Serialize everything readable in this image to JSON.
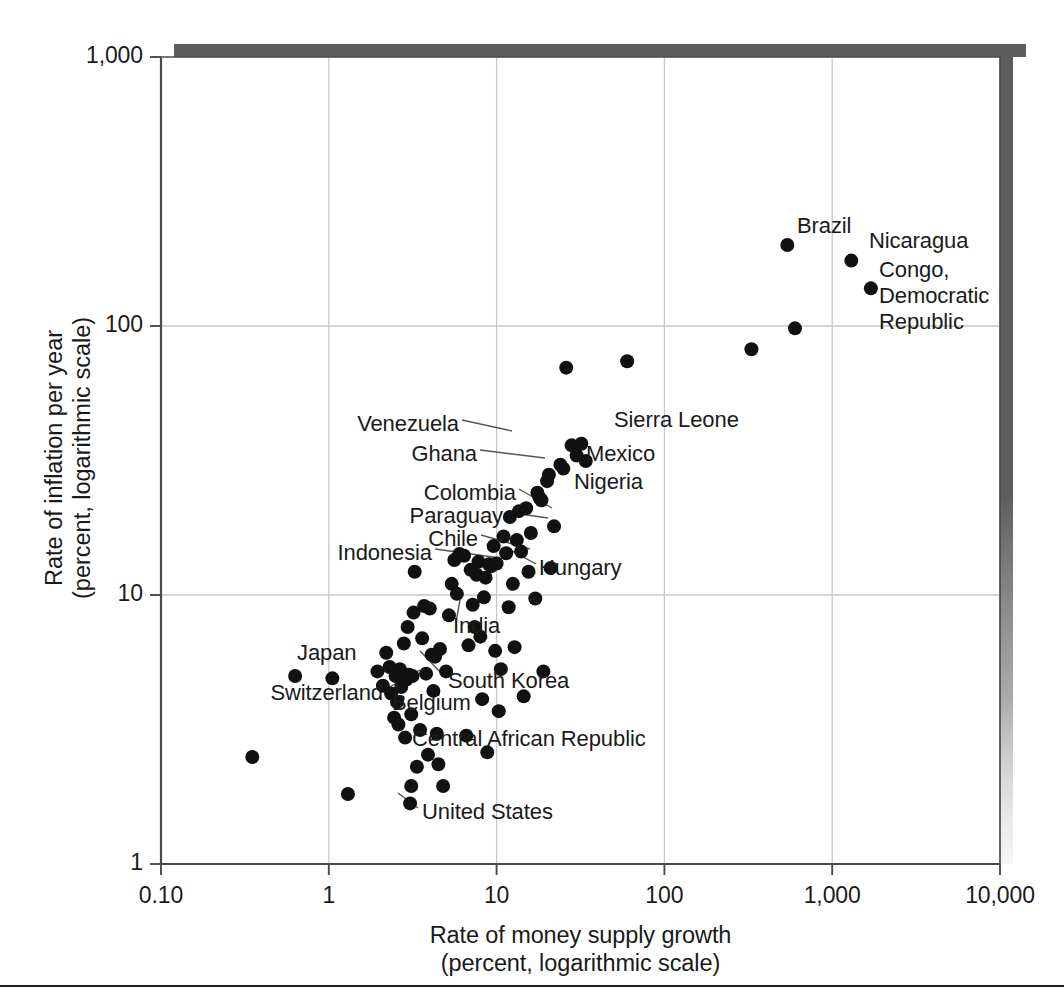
{
  "chart_data": {
    "type": "scatter",
    "title": "",
    "xlabel": "Rate of money supply growth\n(percent, logarithmic scale)",
    "xlabel_line1": "Rate of money supply growth",
    "xlabel_line2": "(percent, logarithmic scale)",
    "ylabel": "Rate of inflation per year\n(percent, logarithmic scale)",
    "ylabel_line1": "Rate of inflation per year",
    "ylabel_line2": "(percent, logarithmic scale)",
    "xscale": "log",
    "yscale": "log",
    "xlim": [
      0.1,
      10000
    ],
    "ylim": [
      1,
      1000
    ],
    "grid": true,
    "legend": "none",
    "x_ticks": [
      {
        "value": 0.1,
        "label": "0.10"
      },
      {
        "value": 1,
        "label": "1"
      },
      {
        "value": 10,
        "label": "10"
      },
      {
        "value": 100,
        "label": "100"
      },
      {
        "value": 1000,
        "label": "1,000"
      },
      {
        "value": 10000,
        "label": "10,000"
      }
    ],
    "y_ticks": [
      {
        "value": 1,
        "label": "1"
      },
      {
        "value": 10,
        "label": "10"
      },
      {
        "value": 100,
        "label": "100"
      },
      {
        "value": 1000,
        "label": "1,000"
      }
    ],
    "marker": {
      "shape": "circle",
      "color": "#111111",
      "radius_px": 7
    },
    "points": [
      {
        "x": 0.35,
        "y": 2.5,
        "label": ""
      },
      {
        "x": 0.63,
        "y": 5.0,
        "label": "Japan"
      },
      {
        "x": 1.05,
        "y": 4.9,
        "label": "Switzerland"
      },
      {
        "x": 1.3,
        "y": 1.82,
        "label": ""
      },
      {
        "x": 1.95,
        "y": 5.2,
        "label": ""
      },
      {
        "x": 2.1,
        "y": 4.6,
        "label": ""
      },
      {
        "x": 2.2,
        "y": 6.1,
        "label": ""
      },
      {
        "x": 2.3,
        "y": 5.4,
        "label": ""
      },
      {
        "x": 2.35,
        "y": 4.3,
        "label": ""
      },
      {
        "x": 2.45,
        "y": 3.5,
        "label": ""
      },
      {
        "x": 2.5,
        "y": 5.0,
        "label": "Belgium"
      },
      {
        "x": 2.55,
        "y": 4.0,
        "label": ""
      },
      {
        "x": 2.6,
        "y": 3.3,
        "label": ""
      },
      {
        "x": 2.65,
        "y": 5.3,
        "label": ""
      },
      {
        "x": 2.7,
        "y": 4.55,
        "label": ""
      },
      {
        "x": 2.8,
        "y": 6.6,
        "label": ""
      },
      {
        "x": 2.85,
        "y": 2.95,
        "label": ""
      },
      {
        "x": 2.9,
        "y": 4.85,
        "label": ""
      },
      {
        "x": 2.95,
        "y": 7.6,
        "label": ""
      },
      {
        "x": 3.0,
        "y": 5.05,
        "label": ""
      },
      {
        "x": 3.05,
        "y": 1.68,
        "label": "United States"
      },
      {
        "x": 3.1,
        "y": 1.95,
        "label": ""
      },
      {
        "x": 3.1,
        "y": 3.6,
        "label": ""
      },
      {
        "x": 3.15,
        "y": 5.0,
        "label": ""
      },
      {
        "x": 3.2,
        "y": 8.6,
        "label": ""
      },
      {
        "x": 3.25,
        "y": 12.2,
        "label": "Indonesia"
      },
      {
        "x": 3.35,
        "y": 2.3,
        "label": ""
      },
      {
        "x": 3.5,
        "y": 3.15,
        "label": ""
      },
      {
        "x": 3.6,
        "y": 6.9,
        "label": ""
      },
      {
        "x": 3.7,
        "y": 9.1,
        "label": ""
      },
      {
        "x": 3.8,
        "y": 5.1,
        "label": ""
      },
      {
        "x": 3.9,
        "y": 2.55,
        "label": ""
      },
      {
        "x": 4.0,
        "y": 8.9,
        "label": ""
      },
      {
        "x": 4.1,
        "y": 6.0,
        "label": ""
      },
      {
        "x": 4.2,
        "y": 4.4,
        "label": ""
      },
      {
        "x": 4.3,
        "y": 5.9,
        "label": ""
      },
      {
        "x": 4.4,
        "y": 3.05,
        "label": ""
      },
      {
        "x": 4.5,
        "y": 2.35,
        "label": ""
      },
      {
        "x": 4.6,
        "y": 6.3,
        "label": ""
      },
      {
        "x": 4.8,
        "y": 1.95,
        "label": ""
      },
      {
        "x": 5.0,
        "y": 5.2,
        "label": "South Korea"
      },
      {
        "x": 5.2,
        "y": 8.4,
        "label": ""
      },
      {
        "x": 5.4,
        "y": 11.0,
        "label": ""
      },
      {
        "x": 5.6,
        "y": 13.5,
        "label": ""
      },
      {
        "x": 5.8,
        "y": 10.1,
        "label": ""
      },
      {
        "x": 6.0,
        "y": 14.2,
        "label": "Chile"
      },
      {
        "x": 6.4,
        "y": 14.0,
        "label": ""
      },
      {
        "x": 6.6,
        "y": 3.0,
        "label": ""
      },
      {
        "x": 6.8,
        "y": 6.5,
        "label": ""
      },
      {
        "x": 7.0,
        "y": 12.4,
        "label": ""
      },
      {
        "x": 7.2,
        "y": 9.2,
        "label": ""
      },
      {
        "x": 7.4,
        "y": 7.6,
        "label": ""
      },
      {
        "x": 7.6,
        "y": 11.9,
        "label": ""
      },
      {
        "x": 7.8,
        "y": 13.3,
        "label": ""
      },
      {
        "x": 8.0,
        "y": 7.0,
        "label": "India"
      },
      {
        "x": 8.2,
        "y": 4.1,
        "label": ""
      },
      {
        "x": 8.4,
        "y": 9.8,
        "label": ""
      },
      {
        "x": 8.6,
        "y": 11.6,
        "label": ""
      },
      {
        "x": 8.8,
        "y": 2.6,
        "label": ""
      },
      {
        "x": 9.0,
        "y": 13.0,
        "label": ""
      },
      {
        "x": 9.3,
        "y": 12.8,
        "label": ""
      },
      {
        "x": 9.6,
        "y": 15.2,
        "label": ""
      },
      {
        "x": 9.8,
        "y": 6.2,
        "label": ""
      },
      {
        "x": 10.0,
        "y": 13.1,
        "label": "Hungary"
      },
      {
        "x": 10.3,
        "y": 3.7,
        "label": ""
      },
      {
        "x": 10.6,
        "y": 5.3,
        "label": ""
      },
      {
        "x": 11.0,
        "y": 16.5,
        "label": ""
      },
      {
        "x": 11.4,
        "y": 14.3,
        "label": ""
      },
      {
        "x": 11.8,
        "y": 9.0,
        "label": ""
      },
      {
        "x": 12.0,
        "y": 19.5,
        "label": "Paraguay"
      },
      {
        "x": 12.5,
        "y": 11.0,
        "label": ""
      },
      {
        "x": 12.8,
        "y": 6.4,
        "label": ""
      },
      {
        "x": 13.2,
        "y": 16.0,
        "label": ""
      },
      {
        "x": 13.6,
        "y": 20.5,
        "label": "Colombia"
      },
      {
        "x": 14.0,
        "y": 14.5,
        "label": ""
      },
      {
        "x": 14.5,
        "y": 4.2,
        "label": ""
      },
      {
        "x": 15.0,
        "y": 21.0,
        "label": ""
      },
      {
        "x": 15.5,
        "y": 12.2,
        "label": ""
      },
      {
        "x": 16.0,
        "y": 17.0,
        "label": ""
      },
      {
        "x": 17.0,
        "y": 9.7,
        "label": ""
      },
      {
        "x": 17.5,
        "y": 24.0,
        "label": ""
      },
      {
        "x": 18.0,
        "y": 23.0,
        "label": "Nigeria"
      },
      {
        "x": 18.5,
        "y": 22.5,
        "label": ""
      },
      {
        "x": 19.0,
        "y": 5.2,
        "label": ""
      },
      {
        "x": 20.0,
        "y": 26.5,
        "label": ""
      },
      {
        "x": 20.5,
        "y": 28.0,
        "label": ""
      },
      {
        "x": 21.0,
        "y": 12.6,
        "label": ""
      },
      {
        "x": 22.0,
        "y": 18.0,
        "label": ""
      },
      {
        "x": 24.0,
        "y": 30.5,
        "label": "Ghana"
      },
      {
        "x": 25.0,
        "y": 29.5,
        "label": "Mexico"
      },
      {
        "x": 26.0,
        "y": 70.0,
        "label": ""
      },
      {
        "x": 28.0,
        "y": 36.0,
        "label": "Venezuela"
      },
      {
        "x": 30.0,
        "y": 33.0,
        "label": ""
      },
      {
        "x": 32.0,
        "y": 36.5,
        "label": "Sierra Leone"
      },
      {
        "x": 34.0,
        "y": 31.5,
        "label": ""
      },
      {
        "x": 60.0,
        "y": 74.0,
        "label": ""
      },
      {
        "x": 330.0,
        "y": 82.0,
        "label": ""
      },
      {
        "x": 540.0,
        "y": 200.0,
        "label": "Brazil"
      },
      {
        "x": 600.0,
        "y": 98.0,
        "label": ""
      },
      {
        "x": 1300.0,
        "y": 175.0,
        "label": "Nicaragua"
      },
      {
        "x": 1700.0,
        "y": 138.0,
        "label": "Congo, Democratic Republic"
      }
    ],
    "annotations": [
      {
        "text": "Brazil",
        "x_px": 797,
        "y_px": 228,
        "anchor": "start",
        "lines": [
          "Brazil"
        ]
      },
      {
        "text": "Nicaragua",
        "x_px": 869,
        "y_px": 243,
        "anchor": "start",
        "lines": [
          "Nicaragua"
        ]
      },
      {
        "text": "Congo, Democratic Republic",
        "x_px": 879,
        "y_px": 272,
        "anchor": "start",
        "lines": [
          "Congo,",
          "Democratic",
          "Republic"
        ]
      },
      {
        "text": "Sierra Leone",
        "x_px": 614,
        "y_px": 422,
        "anchor": "start",
        "lines": [
          "Sierra Leone"
        ]
      },
      {
        "text": "Venezuela",
        "x_px": 459,
        "y_px": 426,
        "anchor": "end",
        "lines": [
          "Venezuela"
        ]
      },
      {
        "text": "Mexico",
        "x_px": 586,
        "y_px": 456,
        "anchor": "start",
        "lines": [
          "Mexico"
        ]
      },
      {
        "text": "Ghana",
        "x_px": 477,
        "y_px": 456,
        "anchor": "end",
        "lines": [
          "Ghana"
        ]
      },
      {
        "text": "Nigeria",
        "x_px": 574,
        "y_px": 484,
        "anchor": "start",
        "lines": [
          "Nigeria"
        ]
      },
      {
        "text": "Colombia",
        "x_px": 516,
        "y_px": 495,
        "anchor": "end",
        "lines": [
          "Colombia"
        ]
      },
      {
        "text": "Paraguay",
        "x_px": 503,
        "y_px": 518,
        "anchor": "end",
        "lines": [
          "Paraguay"
        ]
      },
      {
        "text": "Chile",
        "x_px": 478,
        "y_px": 541,
        "anchor": "end",
        "lines": [
          "Chile"
        ]
      },
      {
        "text": "Indonesia",
        "x_px": 432,
        "y_px": 555,
        "anchor": "end",
        "lines": [
          "Indonesia"
        ]
      },
      {
        "text": "Hungary",
        "x_px": 539,
        "y_px": 570,
        "anchor": "start",
        "lines": [
          "Hungary"
        ]
      },
      {
        "text": "India",
        "x_px": 453,
        "y_px": 628,
        "anchor": "start",
        "lines": [
          "India"
        ]
      },
      {
        "text": "Japan",
        "x_px": 297,
        "y_px": 655,
        "anchor": "start",
        "lines": [
          "Japan"
        ]
      },
      {
        "text": "South Korea",
        "x_px": 448,
        "y_px": 683,
        "anchor": "start",
        "lines": [
          "South Korea"
        ]
      },
      {
        "text": "Switzerland",
        "x_px": 383,
        "y_px": 695,
        "anchor": "end",
        "lines": [
          "Switzerland"
        ]
      },
      {
        "text": "Belgium",
        "x_px": 392,
        "y_px": 705,
        "anchor": "start",
        "lines": [
          "Belgium"
        ]
      },
      {
        "text": "Central African Republic",
        "x_px": 412,
        "y_px": 741,
        "anchor": "start",
        "lines": [
          "Central African Republic"
        ]
      },
      {
        "text": "United States",
        "x_px": 422,
        "y_px": 814,
        "anchor": "start",
        "lines": [
          "United States"
        ]
      }
    ],
    "leader_lines": [
      {
        "from_px": [
          462,
          420
        ],
        "to_px": [
          512,
          431
        ]
      },
      {
        "from_px": [
          480,
          450
        ],
        "to_px": [
          545,
          458
        ]
      },
      {
        "from_px": [
          519,
          489
        ],
        "to_px": [
          552,
          508
        ]
      },
      {
        "from_px": [
          506,
          512
        ],
        "to_px": [
          548,
          518
        ]
      },
      {
        "from_px": [
          481,
          535
        ],
        "to_px": [
          530,
          549
        ]
      },
      {
        "from_px": [
          435,
          549
        ],
        "to_px": [
          500,
          558
        ]
      },
      {
        "from_px": [
          536,
          564
        ],
        "to_px": [
          505,
          547
        ]
      },
      {
        "from_px": [
          456,
          622
        ],
        "to_px": [
          460,
          600
        ]
      },
      {
        "from_px": [
          445,
          677
        ],
        "to_px": [
          420,
          651
        ]
      },
      {
        "from_px": [
          386,
          689
        ],
        "to_px": [
          420,
          670
        ]
      },
      {
        "from_px": [
          399,
          699
        ],
        "to_px": [
          387,
          685
        ]
      },
      {
        "from_px": [
          418,
          808
        ],
        "to_px": [
          398,
          793
        ]
      }
    ]
  },
  "plot_frame": {
    "left_px": 161,
    "top_px": 57,
    "right_px": 1000,
    "bottom_px": 864,
    "axis_color": "#4a4a4a",
    "grid_color": "#c8c8c8",
    "shadow_color": "#5d5d5d"
  }
}
